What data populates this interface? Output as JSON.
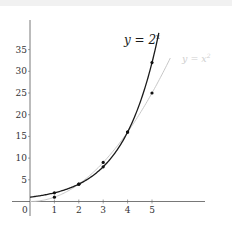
{
  "chart_data": {
    "type": "line",
    "title": "",
    "xlabel": "",
    "ylabel": "",
    "xlim": [
      0,
      6.5
    ],
    "ylim": [
      0,
      40
    ],
    "grid": false,
    "x_ticks": [
      "1",
      "2",
      "3",
      "4",
      "5"
    ],
    "y_ticks": [
      "5",
      "10",
      "15",
      "20",
      "25",
      "30",
      "35"
    ],
    "origin_label": "0",
    "series": [
      {
        "name": "y = 2^x",
        "label_text": "y = 2",
        "label_sup": "x",
        "color": "#1a1a1a",
        "function": "2^x",
        "points": [
          [
            1,
            2
          ],
          [
            2,
            4
          ],
          [
            3,
            8
          ],
          [
            4,
            16
          ],
          [
            5,
            32
          ]
        ]
      },
      {
        "name": "y = x^2",
        "label_text": "y = x",
        "label_sup": "2",
        "color": "#c8c8c8",
        "function": "x^2",
        "points": [
          [
            1,
            1
          ],
          [
            2,
            4
          ],
          [
            3,
            9
          ],
          [
            4,
            16
          ],
          [
            5,
            25
          ]
        ]
      }
    ],
    "legend": "inline labels near curve ends (top right)"
  }
}
